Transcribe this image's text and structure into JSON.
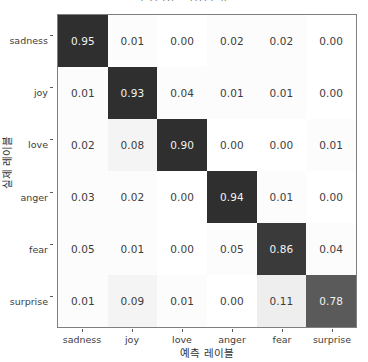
{
  "chart_data": {
    "type": "heatmap",
    "title": "혼동 행렬 - 감정 분류",
    "xlabel": "예측 레이블",
    "ylabel": "실제 레이블",
    "categories": [
      "sadness",
      "joy",
      "love",
      "anger",
      "fear",
      "surprise"
    ],
    "x_tick_labels": [
      "sadness",
      "joy",
      "love",
      "anger",
      "fear",
      "surprise"
    ],
    "y_tick_labels": [
      "sadness",
      "joy",
      "love",
      "anger",
      "fear",
      "surprise"
    ],
    "grid": false,
    "legend": "none",
    "value_format": "0.00",
    "zlim": [
      0.0,
      1.0
    ],
    "colormap": "Greys",
    "rows": [
      {
        "label": "sadness",
        "values": [
          "0.95",
          "0.01",
          "0.00",
          "0.02",
          "0.02",
          "0.00"
        ],
        "numeric": [
          0.95,
          0.01,
          0.0,
          0.02,
          0.02,
          0.0
        ]
      },
      {
        "label": "joy",
        "values": [
          "0.01",
          "0.93",
          "0.04",
          "0.01",
          "0.01",
          "0.00"
        ],
        "numeric": [
          0.01,
          0.93,
          0.04,
          0.01,
          0.01,
          0.0
        ]
      },
      {
        "label": "love",
        "values": [
          "0.02",
          "0.08",
          "0.90",
          "0.00",
          "0.00",
          "0.01"
        ],
        "numeric": [
          0.02,
          0.08,
          0.9,
          0.0,
          0.0,
          0.01
        ]
      },
      {
        "label": "anger",
        "values": [
          "0.03",
          "0.02",
          "0.00",
          "0.94",
          "0.01",
          "0.00"
        ],
        "numeric": [
          0.03,
          0.02,
          0.0,
          0.94,
          0.01,
          0.0
        ]
      },
      {
        "label": "fear",
        "values": [
          "0.05",
          "0.01",
          "0.00",
          "0.05",
          "0.86",
          "0.04"
        ],
        "numeric": [
          0.05,
          0.01,
          0.0,
          0.05,
          0.86,
          0.04
        ]
      },
      {
        "label": "surprise",
        "values": [
          "0.01",
          "0.09",
          "0.01",
          "0.00",
          "0.11",
          "0.78"
        ],
        "numeric": [
          0.01,
          0.09,
          0.01,
          0.0,
          0.11,
          0.78
        ]
      }
    ],
    "colors": {
      "high": "#2f2f2f",
      "low": "#ffffff",
      "text_on_dark": "#f2f2f2",
      "text_on_light": "#3d3d3d",
      "axis_line": "#7f7f7f"
    }
  }
}
